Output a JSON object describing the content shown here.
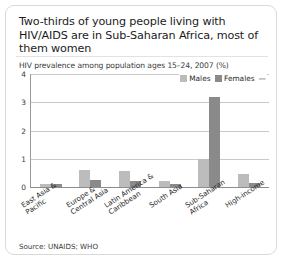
{
  "card": {
    "title": "Two-thirds of young people living with HIV/AIDS are in Sub-Saharan Africa, most of them women",
    "source": "Source: UNAIDS; WHO"
  },
  "colors": {
    "males": "#bcbcbc",
    "females": "#8a8a8a",
    "axis": "#8d8d8d",
    "grid": "#c9c9c9",
    "card_border": "#d9d9d9",
    "text": "#231f20"
  },
  "legend": {
    "males_label": "Males",
    "females_label": "Females"
  },
  "yticks": [
    "4",
    "3",
    "2",
    "1",
    "0"
  ],
  "chart_data": {
    "type": "bar",
    "title": "Two-thirds of young people living with HIV/AIDS are in Sub-Saharan Africa, most of them women",
    "subtitle": "HIV prevalence among population ages 15–24, 2007 (%)",
    "xlabel": "",
    "ylabel": "",
    "ylim": [
      0,
      4
    ],
    "yticks": [
      0,
      1,
      2,
      3,
      4
    ],
    "grid": true,
    "legend_position": "top-right",
    "categories": [
      "East Asia & Pacific",
      "Europe & Central Asia",
      "Latin America & Caribbean",
      "South Asia",
      "Sub-Saharan Africa",
      "High-income"
    ],
    "series": [
      {
        "name": "Males",
        "values": [
          0.1,
          0.6,
          0.55,
          0.2,
          1.0,
          0.45
        ]
      },
      {
        "name": "Females",
        "values": [
          0.1,
          0.25,
          0.2,
          0.1,
          3.2,
          0.15
        ]
      }
    ]
  }
}
